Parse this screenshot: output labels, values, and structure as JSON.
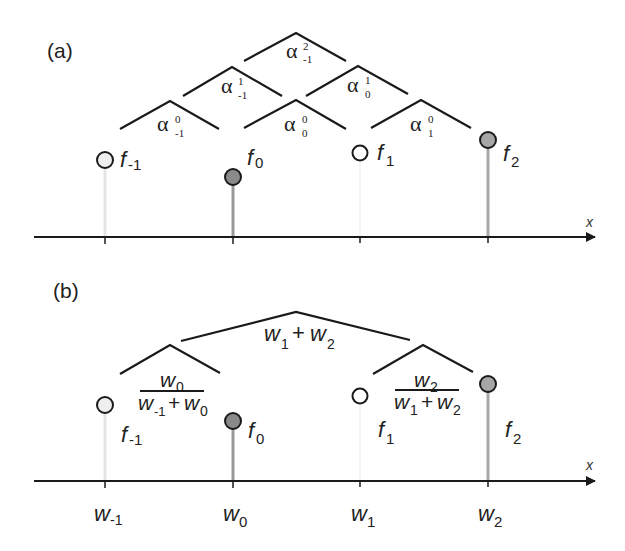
{
  "panel_a": {
    "label": "(a)",
    "axis_label": "x",
    "samples": [
      {
        "name": "f",
        "sub": "-1",
        "x": 105,
        "y": 160,
        "fill": "#eeeeee",
        "stem": "#e6e6e6"
      },
      {
        "name": "f",
        "sub": "0",
        "x": 233,
        "y": 177,
        "fill": "#8a8a8a",
        "stem": "#9a9a9a"
      },
      {
        "name": "f",
        "sub": "1",
        "x": 360,
        "y": 153,
        "fill": "#ffffff",
        "stem": "#f2f2f2"
      },
      {
        "name": "f",
        "sub": "2",
        "x": 488,
        "y": 140,
        "fill": "#a6a6a6",
        "stem": "#a8a8a8"
      }
    ],
    "coefficients": [
      {
        "base": "α",
        "sup": "0",
        "sub": "-1"
      },
      {
        "base": "α",
        "sup": "0",
        "sub": "0"
      },
      {
        "base": "α",
        "sup": "0",
        "sub": "1"
      },
      {
        "base": "α",
        "sup": "1",
        "sub": "-1"
      },
      {
        "base": "α",
        "sup": "1",
        "sub": "0"
      },
      {
        "base": "α",
        "sup": "2",
        "sub": "-1"
      }
    ]
  },
  "panel_b": {
    "label": "(b)",
    "axis_label": "x",
    "samples": [
      {
        "name": "f",
        "sub": "-1",
        "x": 105,
        "y": 405,
        "fill": "#eeeeee",
        "stem": "#e6e6e6"
      },
      {
        "name": "f",
        "sub": "0",
        "x": 233,
        "y": 421,
        "fill": "#8a8a8a",
        "stem": "#9a9a9a"
      },
      {
        "name": "f",
        "sub": "1",
        "x": 360,
        "y": 396,
        "fill": "#ffffff",
        "stem": "#f2f2f2"
      },
      {
        "name": "f",
        "sub": "2",
        "x": 488,
        "y": 384,
        "fill": "#a6a6a6",
        "stem": "#a8a8a8"
      }
    ],
    "tick_labels": [
      {
        "base": "w",
        "sub": "-1"
      },
      {
        "base": "w",
        "sub": "0"
      },
      {
        "base": "w",
        "sub": "1"
      },
      {
        "base": "w",
        "sub": "2"
      }
    ],
    "weights": {
      "left_fraction": {
        "num_base": "w",
        "num_sub": "0",
        "den_a_base": "w",
        "den_a_sub": "-1",
        "plus": "+",
        "den_b_base": "w",
        "den_b_sub": "0"
      },
      "right_fraction": {
        "num_base": "w",
        "num_sub": "2",
        "den_a_base": "w",
        "den_a_sub": "1",
        "plus": "+",
        "den_b_base": "w",
        "den_b_sub": "2"
      },
      "top_sum": {
        "a_base": "w",
        "a_sub": "1",
        "plus": "+",
        "b_base": "w",
        "b_sub": "2"
      }
    }
  }
}
